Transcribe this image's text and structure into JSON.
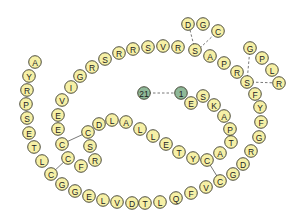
{
  "diagram": {
    "colors": {
      "residue_fill": "#f6f0a6",
      "terminal_fill": "#8fb898",
      "outline": "#3a3a2a",
      "bond": "#555555"
    },
    "terminals": [
      {
        "label": "21",
        "x": 144,
        "y": 93
      },
      {
        "label": "1",
        "x": 181,
        "y": 93
      }
    ],
    "residues": [
      {
        "label": "E",
        "x": 191,
        "y": 103
      },
      {
        "label": "S",
        "x": 203,
        "y": 96
      },
      {
        "label": "K",
        "x": 214,
        "y": 105
      },
      {
        "label": "A",
        "x": 224,
        "y": 116
      },
      {
        "label": "P",
        "x": 230,
        "y": 129
      },
      {
        "label": "T",
        "x": 231,
        "y": 142
      },
      {
        "label": "A",
        "x": 220,
        "y": 153
      },
      {
        "label": "C",
        "x": 207,
        "y": 160
      },
      {
        "label": "Y",
        "x": 193,
        "y": 158
      },
      {
        "label": "T",
        "x": 179,
        "y": 152
      },
      {
        "label": "E",
        "x": 166,
        "y": 144
      },
      {
        "label": "L",
        "x": 153,
        "y": 136
      },
      {
        "label": "L",
        "x": 140,
        "y": 129
      },
      {
        "label": "A",
        "x": 126,
        "y": 122
      },
      {
        "label": "L",
        "x": 112,
        "y": 120
      },
      {
        "label": "D",
        "x": 99,
        "y": 124
      },
      {
        "label": "C",
        "x": 88,
        "y": 132
      },
      {
        "label": "S",
        "x": 90,
        "y": 146
      },
      {
        "label": "R",
        "x": 95,
        "y": 160
      },
      {
        "label": "F",
        "x": 81,
        "y": 166
      },
      {
        "label": "C",
        "x": 68,
        "y": 158
      },
      {
        "label": "C",
        "x": 62,
        "y": 144
      },
      {
        "label": "E",
        "x": 58,
        "y": 129
      },
      {
        "label": "E",
        "x": 58,
        "y": 115
      },
      {
        "label": "V",
        "x": 62,
        "y": 100
      },
      {
        "label": "I",
        "x": 71,
        "y": 87
      },
      {
        "label": "G",
        "x": 80,
        "y": 76
      },
      {
        "label": "R",
        "x": 92,
        "y": 67
      },
      {
        "label": "S",
        "x": 105,
        "y": 59
      },
      {
        "label": "R",
        "x": 119,
        "y": 53
      },
      {
        "label": "R",
        "x": 133,
        "y": 49
      },
      {
        "label": "S",
        "x": 148,
        "y": 47
      },
      {
        "label": "V",
        "x": 163,
        "y": 46
      },
      {
        "label": "R",
        "x": 178,
        "y": 47
      },
      {
        "label": "S",
        "x": 195,
        "y": 50
      },
      {
        "label": "A",
        "x": 210,
        "y": 56
      },
      {
        "label": "P",
        "x": 224,
        "y": 63
      },
      {
        "label": "R",
        "x": 237,
        "y": 72
      },
      {
        "label": "S",
        "x": 247,
        "y": 82
      },
      {
        "label": "F",
        "x": 255,
        "y": 94
      },
      {
        "label": "Y",
        "x": 260,
        "y": 107
      },
      {
        "label": "F",
        "x": 261,
        "y": 122
      },
      {
        "label": "G",
        "x": 259,
        "y": 137
      },
      {
        "label": "R",
        "x": 251,
        "y": 151
      },
      {
        "label": "D",
        "x": 243,
        "y": 164
      },
      {
        "label": "G",
        "x": 233,
        "y": 174
      },
      {
        "label": "C",
        "x": 220,
        "y": 181
      },
      {
        "label": "V",
        "x": 206,
        "y": 187
      },
      {
        "label": "F",
        "x": 191,
        "y": 193
      },
      {
        "label": "Q",
        "x": 176,
        "y": 198
      },
      {
        "label": "L",
        "x": 160,
        "y": 202
      },
      {
        "label": "T",
        "x": 145,
        "y": 203
      },
      {
        "label": "D",
        "x": 132,
        "y": 203
      },
      {
        "label": "V",
        "x": 117,
        "y": 202
      },
      {
        "label": "L",
        "x": 103,
        "y": 200
      },
      {
        "label": "E",
        "x": 89,
        "y": 196
      },
      {
        "label": "G",
        "x": 75,
        "y": 191
      },
      {
        "label": "G",
        "x": 62,
        "y": 184
      },
      {
        "label": "C",
        "x": 51,
        "y": 174
      },
      {
        "label": "L",
        "x": 42,
        "y": 161
      },
      {
        "label": "T",
        "x": 34,
        "y": 147
      },
      {
        "label": "E",
        "x": 29,
        "y": 133
      },
      {
        "label": "S",
        "x": 27,
        "y": 118
      },
      {
        "label": "P",
        "x": 26,
        "y": 104
      },
      {
        "label": "R",
        "x": 27,
        "y": 90
      },
      {
        "label": "Y",
        "x": 29,
        "y": 76
      },
      {
        "label": "A",
        "x": 35,
        "y": 62
      }
    ],
    "branch_top": [
      {
        "label": "D",
        "x": 188,
        "y": 24
      },
      {
        "label": "G",
        "x": 203,
        "y": 24
      },
      {
        "label": "C",
        "x": 218,
        "y": 31
      }
    ],
    "branch_right": [
      {
        "label": "G",
        "x": 250,
        "y": 48
      },
      {
        "label": "P",
        "x": 262,
        "y": 58
      },
      {
        "label": "L",
        "x": 272,
        "y": 70
      },
      {
        "label": "R",
        "x": 279,
        "y": 83
      }
    ],
    "bonds_solid": [
      {
        "x1": 62,
        "y1": 144,
        "x2": 88,
        "y2": 132
      },
      {
        "x1": 68,
        "y1": 158,
        "x2": 51,
        "y2": 174
      },
      {
        "x1": 207,
        "y1": 160,
        "x2": 220,
        "y2": 181
      }
    ],
    "bonds_dashed": [
      {
        "x1": 144,
        "y1": 93,
        "x2": 181,
        "y2": 93
      },
      {
        "x1": 190,
        "y1": 30,
        "x2": 195,
        "y2": 50
      },
      {
        "x1": 218,
        "y1": 31,
        "x2": 200,
        "y2": 48
      },
      {
        "x1": 250,
        "y1": 48,
        "x2": 247,
        "y2": 82
      },
      {
        "x1": 247,
        "y1": 82,
        "x2": 279,
        "y2": 83
      }
    ]
  }
}
